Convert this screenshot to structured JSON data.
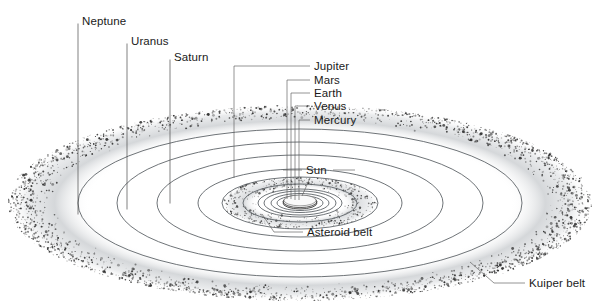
{
  "diagram": {
    "background_color": "#ffffff",
    "center": {
      "x": 300,
      "y": 203
    },
    "line_color": "#555b60",
    "text_color": "#1a1a1a"
  },
  "labels": {
    "neptune": "Neptune",
    "uranus": "Uranus",
    "saturn": "Saturn",
    "jupiter": "Jupiter",
    "mars": "Mars",
    "earth": "Earth",
    "venus": "Venus",
    "mercury": "Mercury",
    "sun": "Sun",
    "asteroid_belt": "Asteroid belt",
    "kuiper_belt": "Kuiper belt"
  },
  "bodies": [
    {
      "name": "Sun",
      "label": "Sun",
      "type": "star",
      "orbit_rx": 17,
      "orbit_ry": 6,
      "label_side": "right"
    },
    {
      "name": "Mercury",
      "label": "Mercury",
      "type": "planet",
      "orbit_rx": 27,
      "orbit_ry": 9,
      "label_side": "right"
    },
    {
      "name": "Venus",
      "label": "Venus",
      "type": "planet",
      "orbit_rx": 36,
      "orbit_ry": 12,
      "label_side": "right"
    },
    {
      "name": "Earth",
      "label": "Earth",
      "type": "planet",
      "orbit_rx": 46,
      "orbit_ry": 15,
      "label_side": "right"
    },
    {
      "name": "Mars",
      "label": "Mars",
      "type": "planet",
      "orbit_rx": 57,
      "orbit_ry": 19,
      "label_side": "right"
    },
    {
      "name": "Jupiter",
      "label": "Jupiter",
      "type": "planet",
      "orbit_rx": 102,
      "orbit_ry": 34,
      "label_side": "right"
    },
    {
      "name": "Saturn",
      "label": "Saturn",
      "type": "planet",
      "orbit_rx": 143,
      "orbit_ry": 48,
      "label_side": "left"
    },
    {
      "name": "Uranus",
      "label": "Uranus",
      "type": "planet",
      "orbit_rx": 183,
      "orbit_ry": 61,
      "label_side": "left"
    },
    {
      "name": "Neptune",
      "label": "Neptune",
      "type": "planet",
      "orbit_rx": 222,
      "orbit_ry": 74,
      "label_side": "left"
    }
  ],
  "belts": [
    {
      "name": "Asteroid belt",
      "label": "Asteroid belt",
      "inner_rx": 42,
      "outer_rx": 78,
      "inner_ry": 14,
      "outer_ry": 26
    },
    {
      "name": "Kuiper belt",
      "label": "Kuiper belt",
      "inner_rx": 248,
      "outer_rx": 292,
      "inner_ry": 83,
      "outer_ry": 98
    }
  ],
  "style": {
    "orbit_stroke": "#555b60",
    "leader_stroke": "#4a4a4a",
    "belt_speckle": "#2b2b2b",
    "sun_fill": "#f2f2f2",
    "label_font_size": "11.5px"
  }
}
